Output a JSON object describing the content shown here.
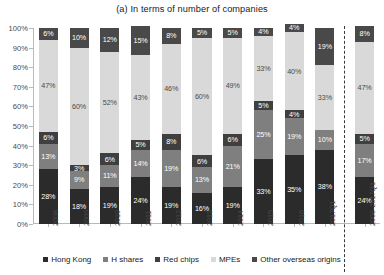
{
  "chart_data": {
    "type": "bar",
    "subtype": "stacked-100-percent",
    "title": "(a) In terms of number of companies",
    "xlabel": "",
    "ylabel": "",
    "ylim": [
      0,
      100
    ],
    "ytick_labels": [
      "0%",
      "10%",
      "20%",
      "30%",
      "40%",
      "50%",
      "60%",
      "70%",
      "80%",
      "90%",
      "100%"
    ],
    "ytick_values": [
      0,
      10,
      20,
      30,
      40,
      50,
      60,
      70,
      80,
      90,
      100
    ],
    "grid": false,
    "legend_position": "bottom",
    "categories": [
      "2008",
      "2009",
      "2010",
      "2011",
      "2012",
      "2013",
      "2014",
      "2015",
      "2016",
      "2017Q1",
      "2008-2017Q1"
    ],
    "series": [
      {
        "name": "Hong Kong",
        "color": "#2b2b2b",
        "values": [
          28,
          18,
          19,
          24,
          19,
          16,
          19,
          33,
          35,
          38,
          24
        ],
        "labels": [
          "28%",
          "18%",
          "19%",
          "24%",
          "19%",
          "16%",
          "19%",
          "33%",
          "35%",
          "38%",
          "24%"
        ]
      },
      {
        "name": "H shares",
        "color": "#7f7f7f",
        "values": [
          13,
          9,
          11,
          14,
          19,
          13,
          21,
          25,
          19,
          10,
          17
        ],
        "labels": [
          "13%",
          "9%",
          "11%",
          "14%",
          "19%",
          "13%",
          "21%",
          "25%",
          "19%",
          "10%",
          "17%"
        ]
      },
      {
        "name": "Red chips",
        "color": "#3f3f3f",
        "values": [
          6,
          3,
          6,
          5,
          8,
          6,
          6,
          5,
          4,
          0,
          5
        ],
        "labels": [
          "6%",
          "3%",
          "6%",
          "5%",
          "8%",
          "6%",
          "6%",
          "5%",
          "4%",
          "0%",
          "5%"
        ]
      },
      {
        "name": "MPEs",
        "color": "#d9d9d9",
        "values": [
          47,
          60,
          52,
          43,
          46,
          60,
          49,
          33,
          40,
          33,
          47
        ],
        "labels": [
          "47%",
          "60%",
          "52%",
          "43%",
          "46%",
          "60%",
          "49%",
          "33%",
          "40%",
          "33%",
          "47%"
        ]
      },
      {
        "name": "Other overseas origins",
        "color": "#494949",
        "values": [
          6,
          10,
          12,
          15,
          8,
          5,
          5,
          4,
          4,
          19,
          8
        ],
        "labels": [
          "6%",
          "10%",
          "12%",
          "15%",
          "8%",
          "5%",
          "5%",
          "4%",
          "4%",
          "19%",
          "8%"
        ]
      }
    ]
  },
  "legend": {
    "items": [
      {
        "label": "Hong Kong",
        "color": "#2b2b2b"
      },
      {
        "label": "H shares",
        "color": "#7f7f7f"
      },
      {
        "label": "Red chips",
        "color": "#3f3f3f"
      },
      {
        "label": "MPEs",
        "color": "#d9d9d9"
      },
      {
        "label": "Other overseas origins",
        "color": "#494949"
      }
    ]
  }
}
